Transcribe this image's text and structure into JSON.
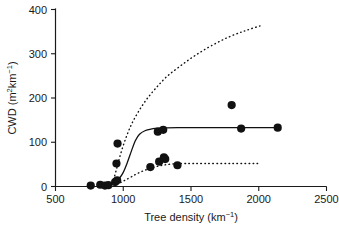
{
  "chart_data": {
    "type": "scatter",
    "title": "",
    "xlabel": "Tree density (km⁻¹)",
    "ylabel": "CWD (m²km⁻¹)",
    "xlabel_parts": {
      "text": "Tree density (km",
      "sup": "−1",
      "tail": ")"
    },
    "ylabel_parts": {
      "head": "CWD (m",
      "sup1": "2",
      "mid": "km",
      "sup2": "−1",
      "tail": ")"
    },
    "xlim": [
      500,
      2500
    ],
    "ylim": [
      0,
      400
    ],
    "xticks": [
      500,
      1000,
      1500,
      2000,
      2500
    ],
    "yticks": [
      0,
      100,
      200,
      300,
      400
    ],
    "xtick_labels": [
      "500",
      "1000",
      "1500",
      "2000",
      "2500"
    ],
    "ytick_labels": [
      "0",
      "100",
      "200",
      "300",
      "400"
    ],
    "grid": false,
    "legend": "none",
    "marker": "filled-circle",
    "marker_color": "#111111",
    "points": [
      {
        "x": 760,
        "y": 2
      },
      {
        "x": 830,
        "y": 4
      },
      {
        "x": 865,
        "y": 2
      },
      {
        "x": 890,
        "y": 3
      },
      {
        "x": 940,
        "y": 10
      },
      {
        "x": 955,
        "y": 14
      },
      {
        "x": 958,
        "y": 97
      },
      {
        "x": 950,
        "y": 52
      },
      {
        "x": 1200,
        "y": 44
      },
      {
        "x": 1265,
        "y": 56
      },
      {
        "x": 1300,
        "y": 66
      },
      {
        "x": 1310,
        "y": 62
      },
      {
        "x": 1400,
        "y": 48
      },
      {
        "x": 1255,
        "y": 124
      },
      {
        "x": 1295,
        "y": 128
      },
      {
        "x": 1800,
        "y": 184
      },
      {
        "x": 1870,
        "y": 131
      },
      {
        "x": 2140,
        "y": 133
      }
    ],
    "curves": [
      {
        "name": "upper-confidence-curve",
        "style": "dotted",
        "points": [
          [
            900,
            0
          ],
          [
            930,
            18
          ],
          [
            955,
            45
          ],
          [
            985,
            78
          ],
          [
            1020,
            110
          ],
          [
            1060,
            140
          ],
          [
            1110,
            168
          ],
          [
            1170,
            196
          ],
          [
            1240,
            222
          ],
          [
            1320,
            248
          ],
          [
            1420,
            272
          ],
          [
            1530,
            296
          ],
          [
            1650,
            318
          ],
          [
            1780,
            338
          ],
          [
            1900,
            352
          ],
          [
            2010,
            363
          ]
        ]
      },
      {
        "name": "mean-fit-curve",
        "style": "solid",
        "points": [
          [
            880,
            2
          ],
          [
            930,
            8
          ],
          [
            970,
            18
          ],
          [
            1000,
            32
          ],
          [
            1030,
            54
          ],
          [
            1060,
            80
          ],
          [
            1090,
            104
          ],
          [
            1120,
            118
          ],
          [
            1160,
            126
          ],
          [
            1210,
            130
          ],
          [
            1260,
            132
          ],
          [
            1400,
            133
          ],
          [
            1700,
            133
          ],
          [
            2000,
            133
          ],
          [
            2140,
            133
          ]
        ]
      },
      {
        "name": "lower-confidence-curve",
        "style": "dotted",
        "points": [
          [
            955,
            5
          ],
          [
            1000,
            12
          ],
          [
            1060,
            22
          ],
          [
            1130,
            33
          ],
          [
            1210,
            42
          ],
          [
            1290,
            48
          ],
          [
            1370,
            51
          ],
          [
            1460,
            52
          ],
          [
            1600,
            52
          ],
          [
            1800,
            52
          ],
          [
            2010,
            52
          ]
        ]
      }
    ]
  },
  "figure": {
    "background": "#ffffff",
    "axis_color": "#1a1a1a",
    "data_color": "#111111"
  }
}
